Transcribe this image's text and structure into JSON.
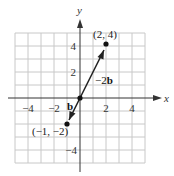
{
  "figure": {
    "axes": {
      "x_label": "x",
      "y_label": "y",
      "x_ticks": [
        {
          "value": -4,
          "label": "−4"
        },
        {
          "value": -2,
          "label": "−2"
        },
        {
          "value": 2,
          "label": "2"
        },
        {
          "value": 4,
          "label": "4"
        }
      ],
      "y_ticks": [
        {
          "value": 4,
          "label": "4"
        },
        {
          "value": 2,
          "label": "2"
        },
        {
          "value": -4,
          "label": "−4"
        }
      ],
      "range": {
        "xmin": -5,
        "xmax": 5,
        "ymin": -5,
        "ymax": 5
      },
      "grid": true
    },
    "points": [
      {
        "name": "point-2-4",
        "x": 2,
        "y": 4,
        "label": "(2, 4)"
      },
      {
        "name": "point-neg1-neg2",
        "x": -1,
        "y": -2,
        "label": "(−1, −2)"
      },
      {
        "name": "origin",
        "x": 0,
        "y": 0,
        "label": ""
      }
    ],
    "vectors": [
      {
        "name": "vector-neg2b",
        "from": [
          0,
          0
        ],
        "to": [
          2,
          4
        ],
        "label_prefix": "−2",
        "label_bold": "b"
      },
      {
        "name": "vector-b",
        "from": [
          0,
          0
        ],
        "to": [
          -1,
          -2
        ],
        "label_prefix": "",
        "label_bold": "b"
      }
    ],
    "colors": {
      "grid": "#c8c8c8",
      "axis": "#333333",
      "vector": "#222222"
    }
  }
}
